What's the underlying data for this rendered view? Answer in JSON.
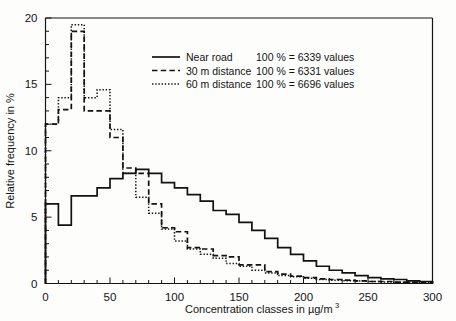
{
  "chart_data": {
    "type": "line",
    "subtype": "step-histogram",
    "title": "",
    "xlabel": "Concentration classes in µg/m³",
    "xlabel_base": "Concentration classes in µg/m",
    "xlabel_exponent": "3",
    "ylabel": "Relative frequency in %",
    "xlim": [
      0,
      300
    ],
    "ylim": [
      0,
      20
    ],
    "xticks": [
      0,
      50,
      100,
      150,
      200,
      250,
      300
    ],
    "xticklabels": [
      "0",
      "50",
      "100",
      "150",
      "200",
      "250",
      "300"
    ],
    "xminor_step": 10,
    "yticks": [
      0,
      5,
      10,
      15,
      20
    ],
    "yticklabels": [
      "0",
      "5",
      "10",
      "15",
      "20"
    ],
    "yminor_step": 1,
    "grid": false,
    "legend_position": "upper-center-right",
    "bin_width": 10,
    "bin_edges": [
      0,
      10,
      20,
      30,
      40,
      50,
      60,
      70,
      80,
      90,
      100,
      110,
      120,
      130,
      140,
      150,
      160,
      170,
      180,
      190,
      200,
      210,
      220,
      230,
      240,
      250,
      260,
      270,
      280,
      290,
      300
    ],
    "series": [
      {
        "name": "Near road",
        "style": "solid",
        "total_label": "100 % = 6339 values",
        "total_values": 6339,
        "values": [
          6.0,
          4.4,
          6.6,
          6.6,
          7.2,
          7.9,
          8.3,
          8.6,
          8.3,
          7.6,
          7.2,
          6.7,
          6.2,
          5.5,
          5.2,
          4.6,
          4.0,
          3.4,
          2.7,
          2.2,
          1.7,
          1.3,
          1.0,
          0.8,
          0.6,
          0.45,
          0.35,
          0.3,
          0.2,
          0.15
        ]
      },
      {
        "name": "30 m distance",
        "style": "dashed",
        "total_label": "100 % = 6331 values",
        "total_values": 6331,
        "values": [
          12.0,
          13.1,
          19.0,
          13.0,
          13.0,
          11.0,
          8.7,
          8.3,
          6.0,
          4.2,
          3.9,
          2.7,
          2.6,
          2.1,
          2.0,
          1.4,
          1.4,
          0.9,
          0.7,
          0.55,
          0.45,
          0.35,
          0.3,
          0.25,
          0.2,
          0.15,
          0.15,
          0.1,
          0.1,
          0.08
        ]
      },
      {
        "name": "60 m distance",
        "style": "dotted",
        "total_label": "100 % = 6696 values",
        "total_values": 6696,
        "values": [
          12.0,
          14.0,
          19.5,
          14.0,
          14.6,
          11.6,
          8.3,
          6.5,
          5.3,
          4.1,
          3.2,
          2.6,
          2.2,
          1.9,
          1.5,
          1.3,
          1.0,
          0.8,
          0.6,
          0.5,
          0.4,
          0.3,
          0.25,
          0.2,
          0.18,
          0.15,
          0.12,
          0.1,
          0.08,
          0.06
        ]
      }
    ],
    "legend_entries": [
      {
        "label": "Near road",
        "style": "solid",
        "note": "100 % = 6339 values"
      },
      {
        "label": "30 m distance",
        "style": "dashed",
        "note": "100 % = 6331 values"
      },
      {
        "label": "60 m distance",
        "style": "dotted",
        "note": "100 % = 6696 values"
      }
    ]
  }
}
